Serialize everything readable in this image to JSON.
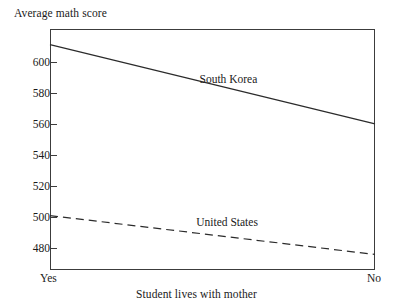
{
  "chart_data": {
    "type": "line",
    "title": "",
    "ylabel": "Average math score",
    "xlabel": "Student lives with mother",
    "categories": [
      "Yes",
      "No"
    ],
    "x": [
      0,
      1
    ],
    "xtick_labels": [
      "Yes",
      "No"
    ],
    "ytick_labels": [
      "480",
      "500",
      "520",
      "540",
      "560",
      "580",
      "600"
    ],
    "yticks": [
      480,
      500,
      520,
      540,
      560,
      580,
      600
    ],
    "ylim": [
      466,
      621
    ],
    "xlim": [
      0,
      1
    ],
    "grid": false,
    "legend": "inline-annotations",
    "series": [
      {
        "name": "South Korea",
        "label": "South Korea",
        "style": "solid",
        "color": "#2b2b2b",
        "values": [
          611,
          560
        ],
        "label_x_frac": 0.46,
        "label_value": 588
      },
      {
        "name": "United States",
        "label": "United States",
        "style": "dashed",
        "color": "#2b2b2b",
        "values": [
          501,
          476
        ],
        "label_x_frac": 0.45,
        "label_value": 496
      }
    ]
  },
  "axis": {
    "y_title": "Average math score",
    "x_title": "Student lives with mother",
    "x_left_label": "Yes",
    "x_right_label": "No",
    "y_ticks": [
      {
        "label": "600",
        "value": 600
      },
      {
        "label": "580",
        "value": 580
      },
      {
        "label": "560",
        "value": 560
      },
      {
        "label": "540",
        "value": 540
      },
      {
        "label": "520",
        "value": 520
      },
      {
        "label": "500",
        "value": 500
      },
      {
        "label": "480",
        "value": 480
      }
    ]
  },
  "annotations": [
    {
      "text": "South Korea"
    },
    {
      "text": "United States"
    }
  ],
  "colors": {
    "axis": "#3c3c3c",
    "line": "#2b2b2b",
    "background": "#ffffff",
    "text": "#1a1a1a"
  }
}
